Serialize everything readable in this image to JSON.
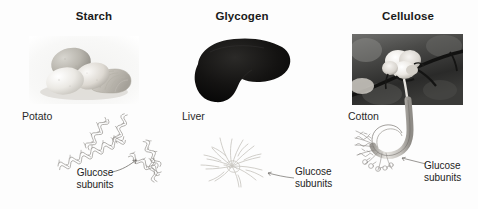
{
  "figure": {
    "background_color": "#fdfdfd",
    "title_color": "#1a1a1a",
    "label_color": "#2a2a2a"
  },
  "columns": [
    {
      "id": "starch",
      "title": "Starch",
      "source_label": "Potato",
      "photo_description": "grayscale photograph of whole and sliced potatoes",
      "structure_description": "helical coiled chains of glucose subunits",
      "callout": {
        "line1": "Glucose",
        "line2": "subunits"
      }
    },
    {
      "id": "glycogen",
      "title": "Glycogen",
      "source_label": "Liver",
      "photo_description": "black silhouette of a liver",
      "structure_description": "highly branched radiating chains of glucose subunits",
      "callout": {
        "line1": "Glucose",
        "line2": "subunits"
      }
    },
    {
      "id": "cellulose",
      "title": "Cellulose",
      "source_label": "Cotton",
      "photo_description": "grayscale photograph of a cotton boll on a branch",
      "structure_description": "cotton fiber looping into bundled microfibrils of glucose subunits",
      "callout": {
        "line1": "Glucose",
        "line2": "subunits"
      }
    }
  ]
}
